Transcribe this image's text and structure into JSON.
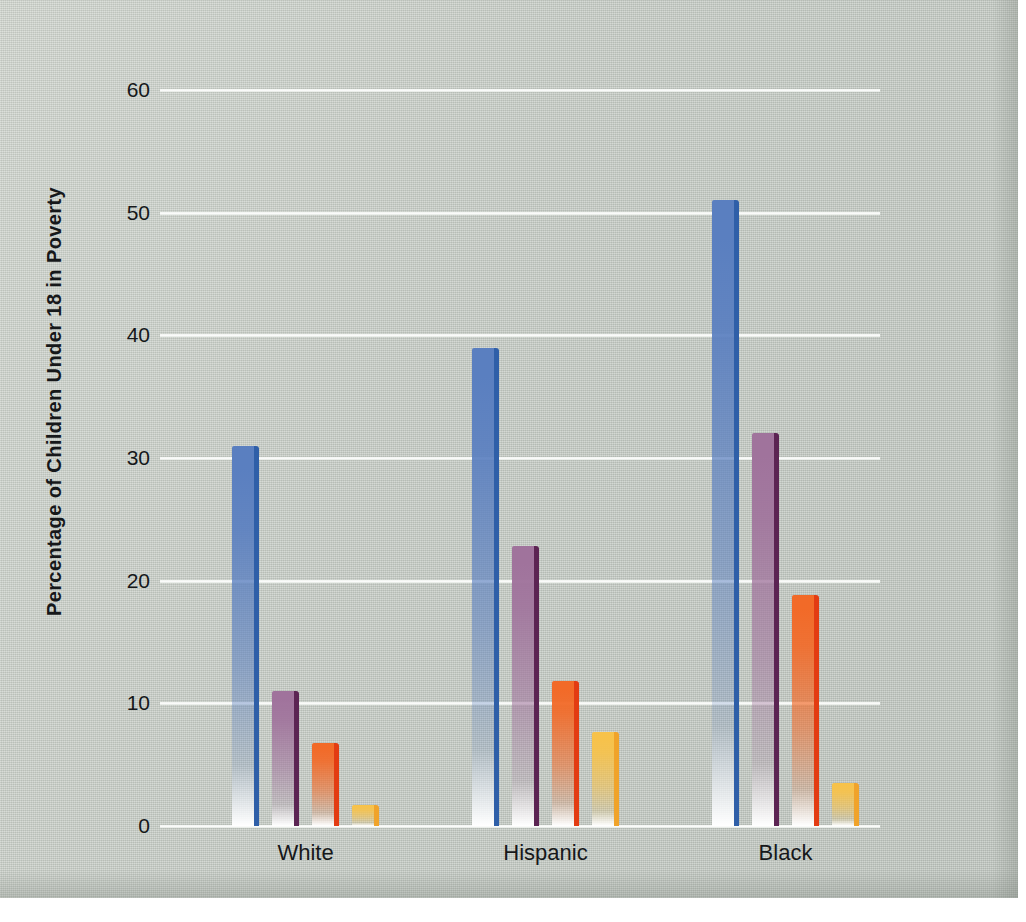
{
  "chart_data": {
    "type": "bar",
    "title": "",
    "subtitle": "",
    "xlabel": "",
    "ylabel": "Percentage of Children Under 18 in Poverty",
    "categories": [
      "White",
      "Hispanic",
      "Black"
    ],
    "ylim": [
      0,
      60
    ],
    "yticks": [
      0,
      10,
      20,
      30,
      40,
      50,
      60
    ],
    "ytick_labels": [
      "0",
      "10",
      "20",
      "30",
      "40",
      "50",
      "60"
    ],
    "grid": true,
    "grid_color": "#ffffff",
    "legend": "none",
    "legend_position": "none",
    "annotations": [],
    "series": [
      {
        "name": "series-1",
        "color": "#5a7fc0",
        "edge_color": "#2f5fa8",
        "values": [
          31,
          39,
          51
        ]
      },
      {
        "name": "series-2",
        "color": "#a0739c",
        "edge_color": "#5c2453",
        "values": [
          11,
          22.8,
          32
        ]
      },
      {
        "name": "series-3",
        "color": "#f26a28",
        "edge_color": "#e33c12",
        "values": [
          6.8,
          11.8,
          18.8
        ]
      },
      {
        "name": "series-4",
        "color": "#f7c24a",
        "edge_color": "#f0a32a",
        "values": [
          1.7,
          7.7,
          3.5
        ]
      }
    ]
  },
  "colors": {
    "background": "#c7cdc6",
    "gridline": "#ffffff",
    "text": "#16181a",
    "series_1": "#5a7fc0",
    "series_2": "#a0739c",
    "series_3": "#f26a28",
    "series_4": "#f7c24a"
  },
  "axis": {
    "y_title": "Percentage of Children Under 18 in Poverty",
    "y_ticks": [
      "60",
      "50",
      "40",
      "30",
      "20",
      "10",
      "0"
    ]
  },
  "x_categories": [
    "White",
    "Hispanic",
    "Black"
  ]
}
